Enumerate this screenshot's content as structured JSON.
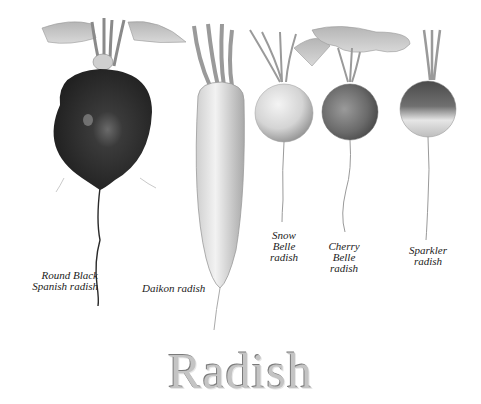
{
  "title": "Radish",
  "colors": {
    "background": "#ffffff",
    "title_fill": "#c4c4c4",
    "title_outline": "#7a7a7a",
    "label_text": "#222222"
  },
  "radishes": [
    {
      "name": "round-black-spanish",
      "label_lines": [
        "Round Black",
        "Spanish radish"
      ]
    },
    {
      "name": "daikon",
      "label_lines": [
        "Daikon radish"
      ]
    },
    {
      "name": "snow-belle",
      "label_lines": [
        "Snow",
        "Belle",
        "radish"
      ]
    },
    {
      "name": "cherry-belle",
      "label_lines": [
        "Cherry",
        "Belle",
        "radish"
      ]
    },
    {
      "name": "sparkler",
      "label_lines": [
        "Sparkler",
        "radish"
      ]
    }
  ]
}
